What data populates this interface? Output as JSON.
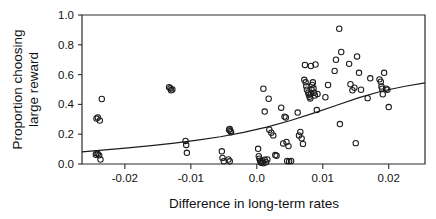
{
  "chart_data": {
    "type": "scatter",
    "title": "",
    "xlabel": "Difference in long-term rates",
    "ylabel": "Proportion choosing large reward",
    "ylabel_line1": "Proportion choosing",
    "ylabel_line2": "large reward",
    "xlim": [
      -0.0265,
      0.0255
    ],
    "ylim": [
      0.0,
      1.0
    ],
    "xticks": [
      -0.02,
      -0.01,
      0.0,
      0.01,
      0.02
    ],
    "xtick_labels": [
      "-0.02",
      "-0.01",
      "0.0",
      "0.01",
      "0.02"
    ],
    "yticks": [
      0.0,
      0.2,
      0.4,
      0.6,
      0.8,
      1.0
    ],
    "ytick_labels": [
      "0.0",
      "0.2",
      "0.4",
      "0.6",
      "0.8",
      "1.0"
    ],
    "grid": false,
    "legend": null,
    "marker": "open-circle",
    "marker_color": "#1c1c1c",
    "points": [
      [
        -0.0243,
        0.305
      ],
      [
        -0.0241,
        0.312
      ],
      [
        -0.0238,
        0.292
      ],
      [
        -0.0235,
        0.436
      ],
      [
        -0.0244,
        0.062
      ],
      [
        -0.0241,
        0.068
      ],
      [
        -0.0239,
        0.058
      ],
      [
        -0.0237,
        0.03
      ],
      [
        -0.0243,
        0.072
      ],
      [
        -0.0133,
        0.515
      ],
      [
        -0.0131,
        0.508
      ],
      [
        -0.013,
        0.495
      ],
      [
        -0.0128,
        0.5
      ],
      [
        -0.0108,
        0.155
      ],
      [
        -0.0107,
        0.128
      ],
      [
        -0.0106,
        0.075
      ],
      [
        -0.0042,
        0.23
      ],
      [
        -0.004,
        0.222
      ],
      [
        -0.0039,
        0.213
      ],
      [
        -0.0041,
        0.235
      ],
      [
        -0.0053,
        0.085
      ],
      [
        -0.0052,
        0.04
      ],
      [
        -0.005,
        0.018
      ],
      [
        -0.0043,
        0.03
      ],
      [
        -0.0041,
        0.018
      ],
      [
        0.0002,
        0.102
      ],
      [
        0.0003,
        0.052
      ],
      [
        0.0004,
        0.035
      ],
      [
        0.0005,
        0.022
      ],
      [
        0.0006,
        0.012
      ],
      [
        0.0007,
        0.008
      ],
      [
        0.0008,
        0.018
      ],
      [
        0.001,
        0.005
      ],
      [
        0.0012,
        0.028
      ],
      [
        0.0014,
        0.012
      ],
      [
        0.0016,
        0.03
      ],
      [
        0.001,
        0.505
      ],
      [
        0.0018,
        0.438
      ],
      [
        0.0012,
        0.352
      ],
      [
        0.0019,
        0.23
      ],
      [
        0.0022,
        0.21
      ],
      [
        0.0025,
        0.192
      ],
      [
        0.0028,
        0.06
      ],
      [
        0.003,
        0.055
      ],
      [
        0.0046,
        0.02
      ],
      [
        0.0049,
        0.018
      ],
      [
        0.0052,
        0.02
      ],
      [
        0.004,
        0.138
      ],
      [
        0.0045,
        0.148
      ],
      [
        0.0048,
        0.12
      ],
      [
        0.0037,
        0.378
      ],
      [
        0.0042,
        0.318
      ],
      [
        0.0044,
        0.312
      ],
      [
        0.0062,
        0.345
      ],
      [
        0.0064,
        0.192
      ],
      [
        0.0066,
        0.215
      ],
      [
        0.0068,
        0.172
      ],
      [
        0.007,
        0.135
      ],
      [
        0.0072,
        0.565
      ],
      [
        0.0074,
        0.548
      ],
      [
        0.0075,
        0.522
      ],
      [
        0.0076,
        0.498
      ],
      [
        0.0078,
        0.478
      ],
      [
        0.0079,
        0.465
      ],
      [
        0.008,
        0.452
      ],
      [
        0.0081,
        0.44
      ],
      [
        0.0082,
        0.472
      ],
      [
        0.0083,
        0.5
      ],
      [
        0.0084,
        0.53
      ],
      [
        0.0085,
        0.548
      ],
      [
        0.0086,
        0.508
      ],
      [
        0.0087,
        0.478
      ],
      [
        0.0088,
        0.46
      ],
      [
        0.0073,
        0.665
      ],
      [
        0.0082,
        0.658
      ],
      [
        0.0089,
        0.668
      ],
      [
        0.0091,
        0.362
      ],
      [
        0.0092,
        0.47
      ],
      [
        0.0104,
        0.448
      ],
      [
        0.0108,
        0.53
      ],
      [
        0.0118,
        0.625
      ],
      [
        0.012,
        0.7
      ],
      [
        0.0125,
        0.908
      ],
      [
        0.0128,
        0.752
      ],
      [
        0.0126,
        0.268
      ],
      [
        0.014,
        0.672
      ],
      [
        0.0142,
        0.535
      ],
      [
        0.0145,
        0.495
      ],
      [
        0.0148,
        0.512
      ],
      [
        0.0152,
        0.722
      ],
      [
        0.0155,
        0.612
      ],
      [
        0.0158,
        0.498
      ],
      [
        0.015,
        0.14
      ],
      [
        0.0168,
        0.442
      ],
      [
        0.0172,
        0.575
      ],
      [
        0.0186,
        0.568
      ],
      [
        0.0188,
        0.552
      ],
      [
        0.0189,
        0.52
      ],
      [
        0.019,
        0.505
      ],
      [
        0.0191,
        0.468
      ],
      [
        0.0193,
        0.612
      ],
      [
        0.0196,
        0.505
      ],
      [
        0.0198,
        0.498
      ],
      [
        0.02,
        0.382
      ]
    ],
    "fit_curve": {
      "label": "logistic fit",
      "x_start": -0.0265,
      "x_end": 0.0255,
      "y_start": 0.082,
      "y_end": 0.545,
      "shape": "slightly-convex-increasing",
      "samples": [
        [
          -0.0265,
          0.082
        ],
        [
          -0.023,
          0.095
        ],
        [
          -0.0195,
          0.108
        ],
        [
          -0.016,
          0.123
        ],
        [
          -0.0125,
          0.14
        ],
        [
          -0.009,
          0.16
        ],
        [
          -0.0055,
          0.183
        ],
        [
          -0.002,
          0.212
        ],
        [
          0.0015,
          0.248
        ],
        [
          0.005,
          0.29
        ],
        [
          0.0085,
          0.34
        ],
        [
          0.012,
          0.393
        ],
        [
          0.0155,
          0.445
        ],
        [
          0.019,
          0.49
        ],
        [
          0.0225,
          0.522
        ],
        [
          0.0255,
          0.545
        ]
      ]
    }
  }
}
